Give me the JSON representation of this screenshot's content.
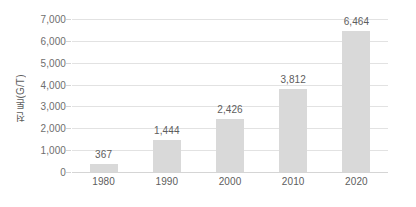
{
  "chart_data": {
    "type": "bar",
    "title": "",
    "subtitle": "",
    "xlabel": "",
    "ylabel": "천 톤(G/T)",
    "categories": [
      "1980",
      "1990",
      "2000",
      "2010",
      "2020"
    ],
    "values": [
      367,
      1444,
      2426,
      3812,
      6464
    ],
    "value_labels": [
      "367",
      "1,444",
      "2,426",
      "3,812",
      "6,464"
    ],
    "series": [
      {
        "name": "천 톤(G/T)",
        "values": [
          367,
          1444,
          2426,
          3812,
          6464
        ],
        "color": "#d9d9d9"
      }
    ],
    "ylim": [
      0,
      7000
    ],
    "ytick_values": [
      0,
      1000,
      2000,
      3000,
      4000,
      5000,
      6000,
      7000
    ],
    "ytick_labels": [
      "0",
      "1,000",
      "2,000",
      "3,000",
      "4,000",
      "5,000",
      "6,000",
      "7,000"
    ],
    "grid": true,
    "grid_axis": "y",
    "legend": false,
    "legend_position": "none",
    "data_labels": true,
    "colors": {
      "bar": "#d9d9d9",
      "gridline": "#e2e2e2",
      "axis": "#d5d5d5",
      "tick_text": "#6e6e6e",
      "label_text": "#5d5d5d",
      "background": "#ffffff"
    }
  }
}
